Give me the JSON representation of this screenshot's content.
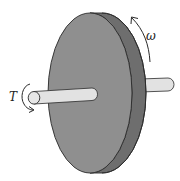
{
  "figure": {
    "labels": {
      "torque": "T",
      "angular_velocity": "ω"
    },
    "colors": {
      "disk_face": "#8f8f8f",
      "disk_rim": "#6e6e6e",
      "shaft": "#e2e2e2",
      "outline": "#2a2a2a",
      "background": "#ffffff"
    }
  }
}
